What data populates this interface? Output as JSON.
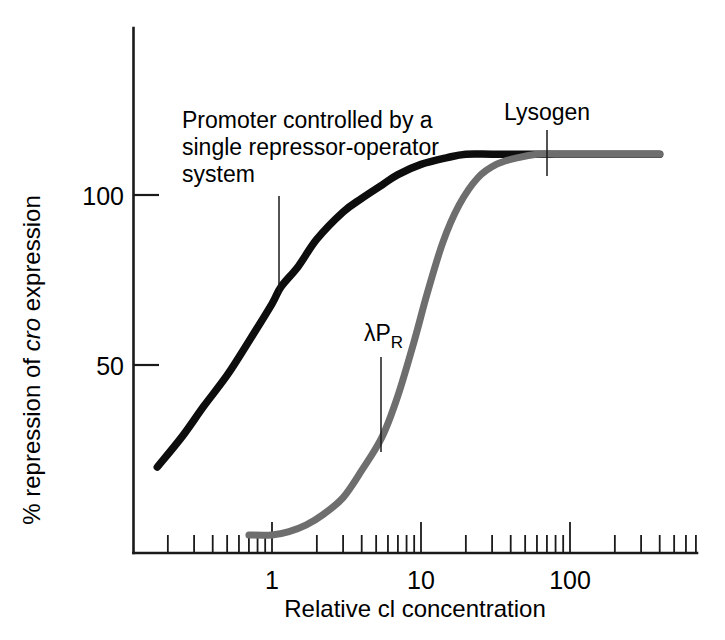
{
  "figure": {
    "background_color": "#ffffff",
    "axis_color": "#1a1a1a"
  },
  "axes": {
    "y": {
      "label_prefix": "% repression of ",
      "label_italic": "cro",
      "label_suffix": " expression",
      "label_full": "% repression of cro expression",
      "ticks": [
        {
          "value": 100,
          "label": "100"
        },
        {
          "value": 50,
          "label": "50"
        }
      ]
    },
    "x": {
      "label": "Relative cI concentration",
      "label_as_printed": "Relative cl concentration",
      "scale": "log10",
      "major_ticks": [
        {
          "value": 1,
          "label": "1"
        },
        {
          "value": 10,
          "label": "10"
        },
        {
          "value": 100,
          "label": "100"
        }
      ],
      "minor_tick_multipliers": [
        2,
        3,
        4,
        5,
        6,
        7,
        8,
        9
      ]
    }
  },
  "annotations": [
    {
      "id": "promoter",
      "lines": [
        "Promoter controlled by a",
        "single repressor-operator",
        "system"
      ],
      "target_series": "single-repressor-operator",
      "target_x": 1.15,
      "target_y": 73
    },
    {
      "id": "lysogen",
      "lines": [
        "Lysogen"
      ],
      "target_series": "lambda-PR",
      "target_x": 68,
      "target_y": 110
    },
    {
      "id": "lambda-pr",
      "text_main": "λP",
      "text_sub": "R",
      "lines": [
        "λPR"
      ],
      "target_series": "lambda-PR",
      "target_x": 5.5,
      "target_y": 29
    }
  ],
  "chart_data": {
    "type": "line",
    "title": "",
    "xlabel": "Relative cI concentration",
    "ylabel": "% repression of cro expression",
    "xscale": "log",
    "xlim": [
      0.17,
      400
    ],
    "ylim": [
      0,
      135
    ],
    "grid": false,
    "legend": "none (curves labelled in-plot)",
    "xticks": [
      1,
      10,
      100
    ],
    "xticklabels": [
      "1",
      "10",
      "100"
    ],
    "yticks": [
      50,
      100
    ],
    "yticklabels": [
      "50",
      "100"
    ],
    "series": [
      {
        "name": "Promoter controlled by a single repressor-operator system",
        "id": "single-repressor-operator",
        "color": "#0d0d0d",
        "shape": "hyperbolic (non-cooperative) binding curve",
        "x": [
          0.17,
          0.25,
          0.35,
          0.5,
          0.7,
          1.0,
          1.15,
          1.5,
          2.0,
          3.0,
          4.0,
          5.5,
          7.0,
          10.0,
          15.0,
          20.0,
          30.0,
          50.0,
          70.0,
          100.0,
          200.0,
          400.0
        ],
        "y": [
          20,
          29,
          38,
          47,
          57,
          68,
          73,
          79,
          87,
          95,
          99,
          103,
          106,
          109,
          111,
          112,
          112,
          112,
          112,
          112,
          112,
          112
        ]
      },
      {
        "name": "λPR",
        "id": "lambda-PR",
        "color": "#6e6e6e",
        "shape": "sigmoidal (cooperative) binding curve",
        "x": [
          0.7,
          1.0,
          1.3,
          1.7,
          2.2,
          3.0,
          4.0,
          5.5,
          7.0,
          9.0,
          11.0,
          14.0,
          18.0,
          24.0,
          32.0,
          45.0,
          60.0,
          80.0,
          100.0,
          200.0,
          400.0
        ],
        "y": [
          0,
          0,
          1,
          3,
          6,
          11,
          19,
          29,
          41,
          57,
          71,
          86,
          97,
          105,
          109,
          111,
          112,
          112,
          112,
          112,
          112
        ]
      }
    ]
  }
}
